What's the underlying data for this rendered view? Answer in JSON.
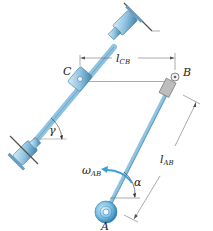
{
  "diagram": {
    "type": "mechanism",
    "points": {
      "A": {
        "label": "A",
        "x": 105,
        "y": 216
      },
      "B": {
        "label": "B",
        "x": 175,
        "y": 77
      },
      "C": {
        "label": "C",
        "x": 80,
        "y": 78
      }
    },
    "dimensions": {
      "l_CB": {
        "label": "l",
        "sub": "CB"
      },
      "l_AB": {
        "label": "l",
        "sub": "AB"
      }
    },
    "angles": {
      "alpha": {
        "label": "α"
      },
      "gamma": {
        "label": "γ"
      }
    },
    "angular_velocity": {
      "label": "ω",
      "sub": "AB"
    },
    "colors": {
      "rod": "#8fc3e0",
      "rod_dark": "#3f7fa8",
      "block": "#b9b9b9",
      "arrow": "#3a9fd8",
      "ground": "#555555"
    }
  }
}
